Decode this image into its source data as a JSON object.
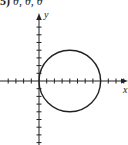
{
  "problem": {
    "number": "5)",
    "values_text": "θ, θ, θ"
  },
  "chart_data": {
    "type": "line",
    "title": "",
    "xlabel": "x",
    "ylabel": "y",
    "xlim": [
      -5,
      11.5
    ],
    "ylim": [
      -8.5,
      8.8
    ],
    "grid": false,
    "x_ticks": [
      -4,
      -3,
      -2,
      -1,
      1,
      2,
      3,
      4,
      5,
      6,
      7,
      8,
      9,
      10,
      11
    ],
    "y_ticks": [
      -8,
      -7,
      -6,
      -5,
      -4,
      -3,
      -2,
      -1,
      1,
      2,
      3,
      4,
      5,
      6,
      7,
      8
    ],
    "series": [
      {
        "name": "circle",
        "shape": "circle",
        "center": [
          4,
          0
        ],
        "radius": 4,
        "color": "#222222"
      }
    ]
  },
  "axes": {
    "x_label": "x",
    "y_label": "y",
    "color": "#222222"
  }
}
